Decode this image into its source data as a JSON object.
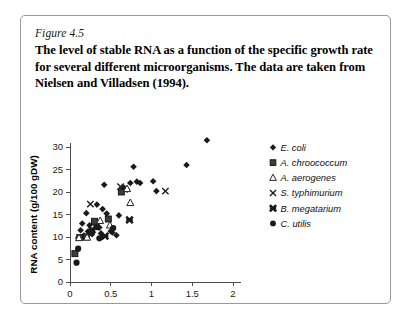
{
  "figure": {
    "number": "Figure 4.5",
    "caption": "The level of stable RNA as a function of the specific growth rate for several different microorganisms. The data are taken from Nielsen and Villadsen (1994)."
  },
  "colors": {
    "marker": "#1a1a1a",
    "axis": "#4d4d4d",
    "frame": "#9a9a9a",
    "background": "#ffffff"
  },
  "chart_data": {
    "type": "scatter",
    "title": "",
    "xlabel": "Specific growth rate (h−1)",
    "ylabel": "RNA content (g/100 gDW)",
    "xlim": [
      0,
      2
    ],
    "ylim": [
      0,
      30
    ],
    "xticks": [
      0,
      0.5,
      1,
      1.5,
      2
    ],
    "xtick_labels": [
      "0",
      "0.5",
      "1",
      "1.5",
      "2"
    ],
    "yticks": [
      0,
      5,
      10,
      15,
      20,
      25,
      30
    ],
    "ytick_labels": [
      "0",
      "5",
      "10",
      "15",
      "20",
      "25",
      "30"
    ],
    "grid": false,
    "legend_position": "right",
    "series": [
      {
        "name": "E. coli",
        "marker": "diamond",
        "points": [
          [
            0.1,
            9.8
          ],
          [
            0.13,
            11.5
          ],
          [
            0.15,
            13.0
          ],
          [
            0.17,
            10.3
          ],
          [
            0.2,
            15.3
          ],
          [
            0.22,
            11.2
          ],
          [
            0.24,
            12.6
          ],
          [
            0.27,
            10.6
          ],
          [
            0.3,
            13.4
          ],
          [
            0.33,
            17.2
          ],
          [
            0.36,
            12.1
          ],
          [
            0.38,
            10.8
          ],
          [
            0.4,
            16.2
          ],
          [
            0.42,
            21.6
          ],
          [
            0.45,
            15.2
          ],
          [
            0.5,
            11.3
          ],
          [
            0.52,
            11.0
          ],
          [
            0.57,
            10.4
          ],
          [
            0.6,
            14.8
          ],
          [
            0.63,
            20.3
          ],
          [
            0.66,
            21.0
          ],
          [
            0.7,
            20.5
          ],
          [
            0.74,
            22.0
          ],
          [
            0.78,
            25.6
          ],
          [
            0.82,
            22.3
          ],
          [
            0.86,
            22.0
          ],
          [
            1.02,
            22.4
          ],
          [
            1.06,
            20.2
          ],
          [
            1.43,
            26.0
          ],
          [
            1.68,
            31.5
          ]
        ]
      },
      {
        "name": "A. chroococcum",
        "marker": "square",
        "points": [
          [
            0.06,
            6.3
          ],
          [
            0.12,
            9.9
          ],
          [
            0.2,
            10.0
          ],
          [
            0.3,
            13.5
          ],
          [
            0.47,
            14.0
          ],
          [
            0.63,
            20.0
          ]
        ]
      },
      {
        "name": "A. aerogenes",
        "marker": "triangle",
        "points": [
          [
            0.11,
            9.8
          ],
          [
            0.21,
            9.9
          ],
          [
            0.37,
            13.6
          ],
          [
            0.49,
            12.6
          ],
          [
            0.74,
            17.6
          ],
          [
            0.7,
            20.7
          ]
        ]
      },
      {
        "name": "S. typhimurium",
        "marker": "cross",
        "points": [
          [
            0.25,
            17.3
          ],
          [
            0.32,
            12.2
          ],
          [
            0.62,
            21.2
          ],
          [
            1.17,
            20.2
          ]
        ]
      },
      {
        "name": "B. megatarium",
        "marker": "boldcross",
        "points": [
          [
            0.43,
            10.2
          ],
          [
            0.73,
            13.8
          ],
          [
            0.27,
            11.6
          ]
        ]
      },
      {
        "name": "C. utilis",
        "marker": "circle",
        "points": [
          [
            0.08,
            4.3
          ],
          [
            0.1,
            7.4
          ],
          [
            0.36,
            9.7
          ],
          [
            0.53,
            12.0
          ],
          [
            0.33,
            12.2
          ]
        ]
      }
    ]
  }
}
